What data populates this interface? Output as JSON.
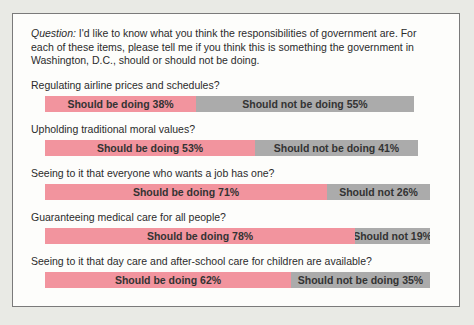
{
  "figure": {
    "question_prefix": "Question:",
    "question_lines": [
      " I'd like to know what you think the responsibilities of government are. For",
      "each of these items, please tell me if you think this is something the government in",
      "Washington, D.C., should or should not be doing."
    ]
  },
  "colors": {
    "should_fill": "#f2949e",
    "should_not_fill": "#ababab",
    "bar_text": "#333333",
    "box_background": "#fdfdfb",
    "page_background": "#e9eae5",
    "border": "#7a7a7a",
    "label_text": "#2b2b2b"
  },
  "chart_data": {
    "type": "bar",
    "orientation": "horizontal-stacked",
    "unit": "percent",
    "px_per_percent": 3.97,
    "legend_position": "none",
    "grid": false,
    "series": [
      "Should be doing",
      "Should not be doing"
    ],
    "items": [
      {
        "question": "Regulating airline prices and schedules?",
        "should_be_doing": 38,
        "should_not_be_doing": 55,
        "should_label": "Should be doing 38%",
        "should_not_label": "Should not be doing 55%"
      },
      {
        "question": "Upholding traditional moral values?",
        "should_be_doing": 53,
        "should_not_be_doing": 41,
        "should_label": "Should be doing 53%",
        "should_not_label": "Should not be doing 41%"
      },
      {
        "question": "Seeing to it that everyone who wants a job has one?",
        "should_be_doing": 71,
        "should_not_be_doing": 26,
        "should_label": "Should be doing 71%",
        "should_not_label": "Should not 26%"
      },
      {
        "question": "Guaranteeing medical care for all people?",
        "should_be_doing": 78,
        "should_not_be_doing": 19,
        "should_label": "Should be doing 78%",
        "should_not_label": "Should not 19%"
      },
      {
        "question": "Seeing to it that day care and after-school care for children are available?",
        "should_be_doing": 62,
        "should_not_be_doing": 35,
        "should_label": "Should be doing 62%",
        "should_not_label": "Should not be doing 35%"
      }
    ]
  }
}
